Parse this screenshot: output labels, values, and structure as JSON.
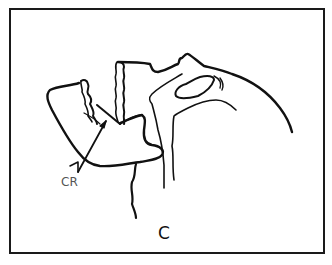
{
  "figure": {
    "panel_label": "C",
    "annotations": [
      {
        "id": "central-ray",
        "label": "CR"
      }
    ],
    "colors": {
      "line": "#111111",
      "background": "#ffffff",
      "label": "#555555"
    }
  }
}
